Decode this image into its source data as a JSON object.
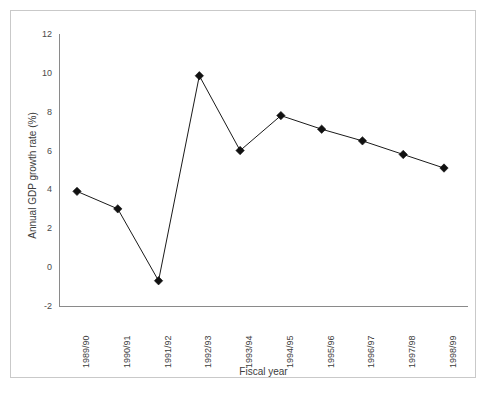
{
  "figure": {
    "top_clipped_caption": "",
    "background_color": "#ffffff",
    "frame_color": "#c9c9c9",
    "marker_color": "#111111",
    "line_color": "#1a1a1a",
    "axis_color": "#8a8a8a"
  },
  "chart_data": {
    "type": "line",
    "title": "",
    "subtitle": "",
    "xlabel": "Fiscal year",
    "ylabel": "Annual GDP growth rate (%)",
    "categories": [
      "1989/90",
      "1990/91",
      "1991/92",
      "1992/93",
      "1993/94",
      "1994/95",
      "1995/96",
      "1996/97",
      "1997/98",
      "1998/99"
    ],
    "values": [
      3.9,
      3.0,
      -0.7,
      9.85,
      6.0,
      7.8,
      7.1,
      6.5,
      5.8,
      5.1
    ],
    "series": [
      {
        "name": "Annual GDP growth rate (%)",
        "values": [
          3.9,
          3.0,
          -0.7,
          9.85,
          6.0,
          7.8,
          7.1,
          6.5,
          5.8,
          5.1
        ]
      }
    ],
    "ylim": [
      -2,
      12
    ],
    "yticks": [
      -2,
      0,
      2,
      4,
      6,
      8,
      10,
      12
    ],
    "ytick_labels": [
      "-2",
      "0",
      "2",
      "4",
      "6",
      "8",
      "10",
      "12"
    ],
    "grid": false,
    "legend": false,
    "legend_position": "none",
    "marker": "diamond",
    "annotations": []
  }
}
